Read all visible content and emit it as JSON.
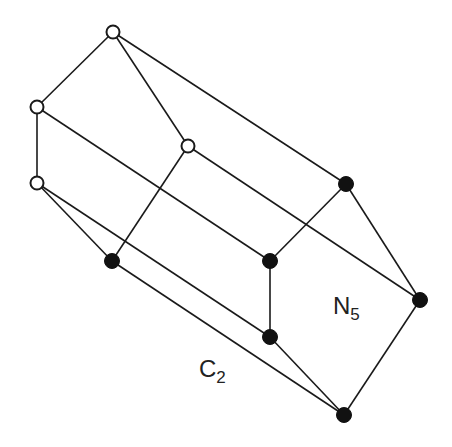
{
  "diagram": {
    "labels": {
      "n5": {
        "main": "N",
        "sub": "5"
      },
      "c2": {
        "main": "C",
        "sub": "2"
      }
    },
    "nodes": [
      {
        "id": "a",
        "x": 113,
        "y": 32,
        "type": "open"
      },
      {
        "id": "b",
        "x": 37,
        "y": 107,
        "type": "open"
      },
      {
        "id": "c",
        "x": 188,
        "y": 146,
        "type": "open"
      },
      {
        "id": "d",
        "x": 37,
        "y": 183,
        "type": "open"
      },
      {
        "id": "e",
        "x": 346,
        "y": 184,
        "type": "filled"
      },
      {
        "id": "f",
        "x": 112,
        "y": 261,
        "type": "filled"
      },
      {
        "id": "g",
        "x": 270,
        "y": 261,
        "type": "filled"
      },
      {
        "id": "h",
        "x": 420,
        "y": 300,
        "type": "filled"
      },
      {
        "id": "i",
        "x": 270,
        "y": 337,
        "type": "filled"
      },
      {
        "id": "j",
        "x": 344,
        "y": 415,
        "type": "filled"
      }
    ],
    "edges": [
      [
        "a",
        "b"
      ],
      [
        "a",
        "c"
      ],
      [
        "a",
        "e"
      ],
      [
        "b",
        "d"
      ],
      [
        "b",
        "g"
      ],
      [
        "c",
        "f"
      ],
      [
        "c",
        "h"
      ],
      [
        "d",
        "f"
      ],
      [
        "d",
        "i"
      ],
      [
        "e",
        "g"
      ],
      [
        "e",
        "h"
      ],
      [
        "g",
        "i"
      ],
      [
        "f",
        "j"
      ],
      [
        "i",
        "j"
      ],
      [
        "h",
        "j"
      ]
    ]
  }
}
